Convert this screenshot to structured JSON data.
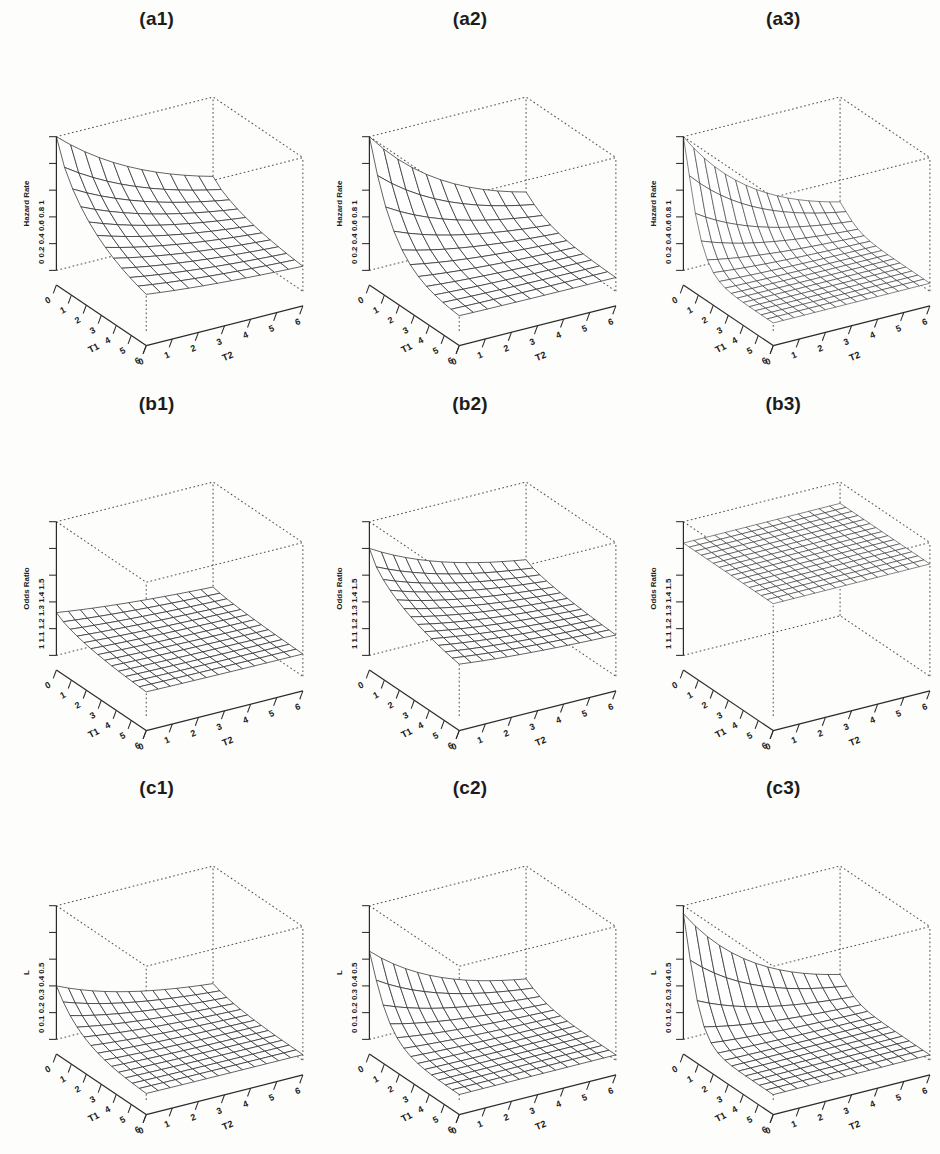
{
  "figure": {
    "background_color": "#fdfdfb",
    "ink_color": "#2b2b2b",
    "rows": 3,
    "cols": 3
  },
  "chart_data": [
    {
      "type": "surface",
      "title": "(a1)",
      "xlabel": "T1",
      "ylabel": "T2",
      "zlabel": "Hazard Rate",
      "xticks": [
        "0",
        "1",
        "2",
        "3",
        "4",
        "5",
        "6"
      ],
      "yticks": [
        "0",
        "1",
        "2",
        "3",
        "4",
        "5",
        "6"
      ],
      "zticks": [
        "0",
        "0.2",
        "0.4",
        "0.6",
        "0.8",
        "1"
      ],
      "zlim": [
        0,
        1
      ],
      "xlim": [
        0,
        6
      ],
      "ylim": [
        0,
        6
      ],
      "grid": true,
      "mesh_n": 11,
      "surface": "decaying hazard, value 1 at origin falling smoothly toward 0.15 at far corner, mild curvature",
      "z_origin": 1.0,
      "z_far": 0.15,
      "decay_t1": 0.42,
      "decay_t2": 0.2,
      "curvature": 1.0
    },
    {
      "type": "surface",
      "title": "(a2)",
      "xlabel": "T1",
      "ylabel": "T2",
      "zlabel": "Hazard Rate",
      "xticks": [
        "0",
        "1",
        "2",
        "3",
        "4",
        "5",
        "6"
      ],
      "yticks": [
        "0",
        "1",
        "2",
        "3",
        "4",
        "5",
        "6"
      ],
      "zticks": [
        "0",
        "0.2",
        "0.4",
        "0.6",
        "0.8",
        "1"
      ],
      "zlim": [
        0,
        1
      ],
      "xlim": [
        0,
        6
      ],
      "ylim": [
        0,
        6
      ],
      "grid": true,
      "mesh_n": 11,
      "surface": "decaying hazard with sharper initial drop than (a1), reaching low plateau sooner",
      "z_origin": 1.0,
      "z_far": 0.1,
      "decay_t1": 0.62,
      "decay_t2": 0.26,
      "curvature": 1.25
    },
    {
      "type": "surface",
      "title": "(a3)",
      "xlabel": "T1",
      "ylabel": "T2",
      "zlabel": "Hazard Rate",
      "xticks": [
        "0",
        "1",
        "2",
        "3",
        "4",
        "5",
        "6"
      ],
      "yticks": [
        "0",
        "1",
        "2",
        "3",
        "4",
        "5",
        "6"
      ],
      "zticks": [
        "0",
        "0.2",
        "0.4",
        "0.6",
        "0.8",
        "1"
      ],
      "zlim": [
        0,
        1
      ],
      "xlim": [
        0,
        6
      ],
      "ylim": [
        0,
        6
      ],
      "grid": true,
      "mesh_n": 15,
      "surface": "steepest hazard decay, near-vertical drop at the T1 origin edge, dense fine mesh",
      "z_origin": 1.0,
      "z_far": 0.06,
      "decay_t1": 1.05,
      "decay_t2": 0.3,
      "curvature": 1.5
    },
    {
      "type": "surface",
      "title": "(b1)",
      "xlabel": "T1",
      "ylabel": "T2",
      "zlabel": "Odds Ratio",
      "xticks": [
        "0",
        "1",
        "2",
        "3",
        "4",
        "5",
        "6"
      ],
      "yticks": [
        "0",
        "1",
        "2",
        "3",
        "4",
        "5",
        "6"
      ],
      "zticks": [
        "1",
        "1.1",
        "1.2",
        "1.3",
        "1.4",
        "1.5"
      ],
      "zlim": [
        1,
        1.5
      ],
      "xlim": [
        0,
        6
      ],
      "ylim": [
        0,
        6
      ],
      "grid": true,
      "mesh_n": 13,
      "surface": "nearly flat low sheet just above 1.1, slight lift toward the T1 origin edge",
      "z_origin": 1.16,
      "z_far": 1.08,
      "decay_t1": 0.45,
      "decay_t2": 0.18,
      "curvature": 1.0
    },
    {
      "type": "surface",
      "title": "(b2)",
      "xlabel": "T1",
      "ylabel": "T2",
      "zlabel": "Odds Ratio",
      "xticks": [
        "0",
        "1",
        "2",
        "3",
        "4",
        "5",
        "6"
      ],
      "yticks": [
        "0",
        "1",
        "2",
        "3",
        "4",
        "5",
        "6"
      ],
      "zticks": [
        "1",
        "1.1",
        "1.2",
        "1.3",
        "1.4",
        "1.5"
      ],
      "zlim": [
        1,
        1.5
      ],
      "xlim": [
        0,
        6
      ],
      "ylim": [
        0,
        6
      ],
      "grid": true,
      "mesh_n": 13,
      "surface": "sheet starting near 1.40 at the origin and sloping down to about 1.15 at the far corner",
      "z_origin": 1.4,
      "z_far": 1.14,
      "decay_t1": 0.4,
      "decay_t2": 0.22,
      "curvature": 0.9
    },
    {
      "type": "surface",
      "title": "(b3)",
      "xlabel": "T1",
      "ylabel": "T2",
      "zlabel": "Odds Ratio",
      "xticks": [
        "0",
        "1",
        "2",
        "3",
        "4",
        "5",
        "6"
      ],
      "yticks": [
        "0",
        "1",
        "2",
        "3",
        "4",
        "5",
        "6"
      ],
      "zticks": [
        "1",
        "1.1",
        "1.2",
        "1.3",
        "1.4",
        "1.5"
      ],
      "zlim": [
        1,
        1.5
      ],
      "xlim": [
        0,
        6
      ],
      "ylim": [
        0,
        6
      ],
      "grid": true,
      "mesh_n": 15,
      "surface": "perfectly flat constant plane at approximately 1.42 across the whole T1-T2 domain",
      "z_origin": 1.42,
      "z_far": 1.42,
      "decay_t1": 0.0,
      "decay_t2": 0.0,
      "curvature": 1.0
    },
    {
      "type": "surface",
      "title": "(c1)",
      "xlabel": "T1",
      "ylabel": "T2",
      "zlabel": "L",
      "xticks": [
        "0",
        "1",
        "2",
        "3",
        "4",
        "5",
        "6"
      ],
      "yticks": [
        "0",
        "1",
        "2",
        "3",
        "4",
        "5",
        "6"
      ],
      "zticks": [
        "0",
        "0.1",
        "0.2",
        "0.3",
        "0.4",
        "0.5"
      ],
      "zlim": [
        0,
        0.5
      ],
      "xlim": [
        0,
        6
      ],
      "ylim": [
        0,
        6
      ],
      "grid": true,
      "mesh_n": 13,
      "surface": "L decaying from about 0.20 at the origin to near 0.02 over the domain",
      "z_origin": 0.2,
      "z_far": 0.02,
      "decay_t1": 0.6,
      "decay_t2": 0.25,
      "curvature": 1.2
    },
    {
      "type": "surface",
      "title": "(c2)",
      "xlabel": "T1",
      "ylabel": "T2",
      "zlabel": "L",
      "xticks": [
        "0",
        "1",
        "2",
        "3",
        "4",
        "5",
        "6"
      ],
      "yticks": [
        "0",
        "1",
        "2",
        "3",
        "4",
        "5",
        "6"
      ],
      "zticks": [
        "0",
        "0.1",
        "0.2",
        "0.3",
        "0.4",
        "0.5"
      ],
      "zlim": [
        0,
        0.5
      ],
      "xlim": [
        0,
        6
      ],
      "ylim": [
        0,
        6
      ],
      "grid": true,
      "mesh_n": 13,
      "surface": "L with a sharper origin peak near 0.33 decaying quickly to a flat low tail",
      "z_origin": 0.33,
      "z_far": 0.02,
      "decay_t1": 0.85,
      "decay_t2": 0.28,
      "curvature": 1.35
    },
    {
      "type": "surface",
      "title": "(c3)",
      "xlabel": "T1",
      "ylabel": "T2",
      "zlabel": "L",
      "xticks": [
        "0",
        "1",
        "2",
        "3",
        "4",
        "5",
        "6"
      ],
      "yticks": [
        "0",
        "1",
        "2",
        "3",
        "4",
        "5",
        "6"
      ],
      "zticks": [
        "0",
        "0.1",
        "0.2",
        "0.3",
        "0.4",
        "0.5"
      ],
      "zlim": [
        0,
        0.5
      ],
      "xlim": [
        0,
        6
      ],
      "ylim": [
        0,
        6
      ],
      "grid": true,
      "mesh_n": 13,
      "surface": "L with the sharpest origin spike near 0.47, collapsing steeply to a flat tail",
      "z_origin": 0.47,
      "z_far": 0.02,
      "decay_t1": 1.15,
      "decay_t2": 0.3,
      "curvature": 1.5
    }
  ]
}
